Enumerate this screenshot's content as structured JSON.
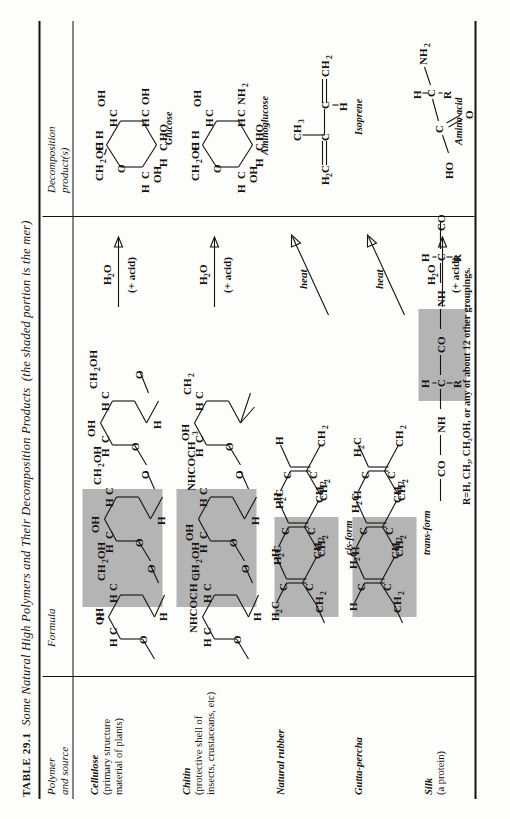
{
  "table": {
    "number": "TABLE 29.1",
    "title": "Some Natural High Polymers and Their Decomposition Products",
    "title_paren": "(the shaded portion is the mer)",
    "columns": [
      {
        "id": "polymer",
        "label_line1": "Polymer",
        "label_line2": "and source"
      },
      {
        "id": "formula",
        "label_line1": "Formula",
        "label_line2": ""
      },
      {
        "id": "decomp",
        "label_line1": "Decomposition",
        "label_line2": "product(s)"
      }
    ],
    "rows": [
      {
        "id": "cellulose",
        "name": "Cellulose",
        "source_line1": "(primary structure",
        "source_line2": "material of plants)",
        "arrow_top": "H₂O",
        "arrow_bottom": "(+ acid)",
        "product_caption": "Glucose",
        "formula_caption": ""
      },
      {
        "id": "chitin",
        "name": "Chitin",
        "source_line1": "(protective shell of",
        "source_line2": "insects, crustaceans, etc)",
        "arrow_top": "H₂O",
        "arrow_bottom": "(+ acid)",
        "product_caption": "Aminoglucose",
        "formula_caption": ""
      },
      {
        "id": "natural-rubber",
        "name": "Natural rubber",
        "source_line1": "",
        "source_line2": "",
        "arrow_top": "heat",
        "arrow_bottom": "",
        "product_caption": "Isoprene",
        "formula_caption": "cis-form"
      },
      {
        "id": "gutta-percha",
        "name": "Gutta-percha",
        "source_line1": "",
        "source_line2": "",
        "arrow_top": "heat",
        "arrow_bottom": "",
        "product_caption": "",
        "formula_caption": "trans-form"
      },
      {
        "id": "silk",
        "name": "Silk",
        "source_line1": "(a protein)",
        "source_line2": "",
        "arrow_top": "H₂O",
        "arrow_bottom": "(+ acid)",
        "product_caption": "Amino acid",
        "formula_caption": ""
      }
    ],
    "footnote": "R=H, CH₃, CH₂OH, or any of about 12 other groupings.",
    "shade_color": "#b4b4b4",
    "ink_color": "#15120f",
    "paper_color": "#fdfdfb"
  },
  "chem": {
    "labels": {
      "CH2OH": "CH",
      "H": "H",
      "O": "O",
      "OH": "OH",
      "C": "C",
      "HO": "HO",
      "NH2": "NH",
      "NHCOCH3": "NHCOCH",
      "CH3": "CH",
      "H2C": "H",
      "CO": "CO",
      "NH": "NH",
      "R": "R"
    }
  }
}
